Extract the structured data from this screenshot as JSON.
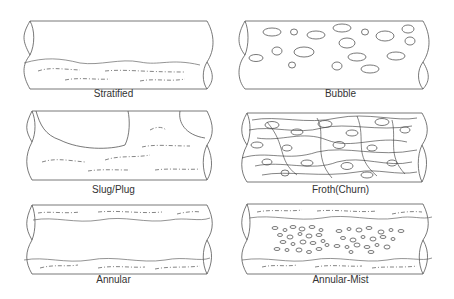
{
  "diagram": {
    "panels": [
      {
        "id": "stratified",
        "label": "Stratified"
      },
      {
        "id": "bubble",
        "label": "Bubble"
      },
      {
        "id": "slug-plug",
        "label": "Slug/Plug"
      },
      {
        "id": "froth-churn",
        "label": "Froth(Churn)"
      },
      {
        "id": "annular",
        "label": "Annular"
      },
      {
        "id": "annular-mist",
        "label": "Annular-Mist"
      }
    ]
  }
}
